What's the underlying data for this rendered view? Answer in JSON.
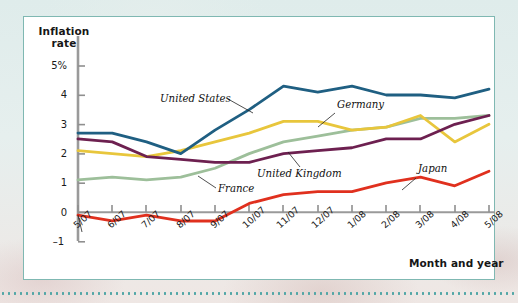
{
  "figure": {
    "background_color": "#e8f1ef",
    "card_background": "#ffffff",
    "card_border_color": "#7fb8b2"
  },
  "axes": {
    "y_title_line1": "Inflation",
    "y_title_line2": "rate",
    "x_title": "Month and year",
    "y_ticks": [
      "5%",
      "4",
      "3",
      "2",
      "1",
      "0",
      "–1"
    ],
    "x_ticks": [
      "5/07",
      "6/07",
      "7/07",
      "8/07",
      "9/07",
      "10/07",
      "11/07",
      "12/07",
      "1/08",
      "2/08",
      "3/08",
      "4/08",
      "5/08"
    ]
  },
  "chart_data": {
    "type": "line",
    "title": "",
    "subtitle": "",
    "xlabel": "Month and year",
    "ylabel": "Inflation rate",
    "xlim": [
      0,
      12
    ],
    "ylim": [
      -1,
      5
    ],
    "grid": false,
    "legend": "inline-annotations",
    "x": [
      "5/07",
      "6/07",
      "7/07",
      "8/07",
      "9/07",
      "10/07",
      "11/07",
      "12/07",
      "1/08",
      "2/08",
      "3/08",
      "4/08",
      "5/08"
    ],
    "series": [
      {
        "name": "United States",
        "color": "#1f5f82",
        "values": [
          2.7,
          2.7,
          2.4,
          2.0,
          2.8,
          3.5,
          4.3,
          4.1,
          4.3,
          4.0,
          4.0,
          3.9,
          4.2
        ]
      },
      {
        "name": "Germany",
        "color": "#e8c63c",
        "values": [
          2.1,
          2.0,
          1.9,
          2.1,
          2.4,
          2.7,
          3.1,
          3.1,
          2.8,
          2.9,
          3.3,
          2.4,
          3.0
        ]
      },
      {
        "name": "United Kingdom",
        "color": "#6d2050",
        "values": [
          2.5,
          2.4,
          1.9,
          1.8,
          1.7,
          1.7,
          2.0,
          2.1,
          2.2,
          2.5,
          2.5,
          3.0,
          3.3
        ]
      },
      {
        "name": "France",
        "color": "#9dbf9a",
        "values": [
          1.1,
          1.2,
          1.1,
          1.2,
          1.5,
          2.0,
          2.4,
          2.6,
          2.8,
          2.9,
          3.2,
          3.2,
          3.3
        ]
      },
      {
        "name": "Japan",
        "color": "#e0301e",
        "values": [
          -0.1,
          -0.3,
          -0.1,
          -0.3,
          -0.3,
          0.3,
          0.6,
          0.7,
          0.7,
          1.0,
          1.2,
          0.9,
          1.4
        ]
      }
    ],
    "annotations": [
      {
        "text": "United States",
        "series": "United States"
      },
      {
        "text": "Germany",
        "series": "Germany"
      },
      {
        "text": "United Kingdom",
        "series": "United Kingdom"
      },
      {
        "text": "France",
        "series": "France"
      },
      {
        "text": "Japan",
        "series": "Japan"
      }
    ]
  }
}
